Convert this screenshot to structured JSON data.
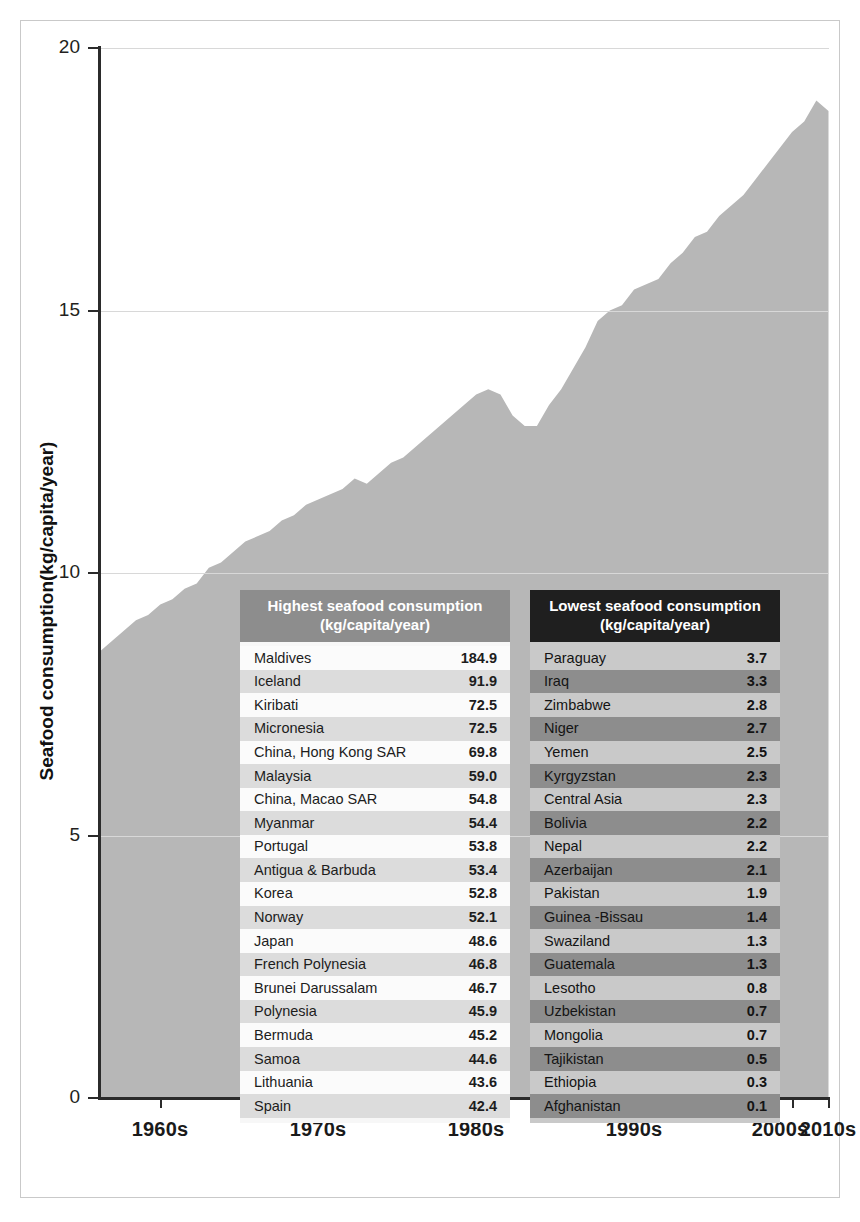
{
  "chart_data": {
    "type": "area",
    "title": "",
    "xlabel": "",
    "ylabel": "Seafood consumption(kg/capita/year)",
    "ylim": [
      0,
      20
    ],
    "y_ticks": [
      0,
      5,
      10,
      15,
      20
    ],
    "x_ticks": [
      "1960s",
      "1970s",
      "1980s",
      "1990s",
      "2000s",
      "2010s"
    ],
    "grid": "horizontal",
    "legend": "none",
    "series_name": "World seafood consumption",
    "series_color": "#b7b7b7",
    "x": [
      1955,
      1956,
      1957,
      1958,
      1959,
      1960,
      1961,
      1962,
      1963,
      1964,
      1965,
      1966,
      1967,
      1968,
      1969,
      1970,
      1971,
      1972,
      1973,
      1974,
      1975,
      1976,
      1977,
      1978,
      1979,
      1980,
      1981,
      1982,
      1983,
      1984,
      1985,
      1986,
      1987,
      1988,
      1989,
      1990,
      1991,
      1992,
      1993,
      1994,
      1995,
      1996,
      1997,
      1998,
      1999,
      2000,
      2001,
      2002,
      2003,
      2004,
      2005,
      2006,
      2007,
      2008,
      2009,
      2010,
      2011,
      2012,
      2013,
      2014,
      2015
    ],
    "values": [
      8.5,
      8.7,
      8.9,
      9.1,
      9.2,
      9.4,
      9.5,
      9.7,
      9.8,
      10.1,
      10.2,
      10.4,
      10.6,
      10.7,
      10.8,
      11.0,
      11.1,
      11.3,
      11.4,
      11.5,
      11.6,
      11.8,
      11.7,
      11.9,
      12.1,
      12.2,
      12.4,
      12.6,
      12.8,
      13.0,
      13.2,
      13.4,
      13.5,
      13.4,
      13.0,
      12.8,
      12.8,
      13.2,
      13.5,
      13.9,
      14.3,
      14.8,
      15.0,
      15.1,
      15.4,
      15.5,
      15.6,
      15.9,
      16.1,
      16.4,
      16.5,
      16.8,
      17.0,
      17.2,
      17.5,
      17.8,
      18.1,
      18.4,
      18.6,
      19.0,
      18.8
    ]
  },
  "axis": {
    "y_title": "Seafood consumption(kg/capita/year)",
    "y_ticks": [
      {
        "label": "20",
        "value": 20
      },
      {
        "label": "15",
        "value": 15
      },
      {
        "label": "10",
        "value": 10
      },
      {
        "label": "5",
        "value": 5
      },
      {
        "label": "0",
        "value": 0
      }
    ],
    "x_ticks": [
      {
        "label": "1960s"
      },
      {
        "label": "1970s"
      },
      {
        "label": "1980s"
      },
      {
        "label": "1990s"
      },
      {
        "label": "2000s"
      },
      {
        "label": "2010s"
      }
    ]
  },
  "tables": {
    "highest": {
      "header_line1": "Highest seafood consumption",
      "header_line2": "(kg/capita/year)",
      "rows": [
        {
          "country": "Maldives",
          "value": "184.9"
        },
        {
          "country": "Iceland",
          "value": "91.9"
        },
        {
          "country": "Kiribati",
          "value": "72.5"
        },
        {
          "country": "Micronesia",
          "value": "72.5"
        },
        {
          "country": "China, Hong Kong SAR",
          "value": "69.8"
        },
        {
          "country": "Malaysia",
          "value": "59.0"
        },
        {
          "country": "China, Macao SAR",
          "value": "54.8"
        },
        {
          "country": "Myanmar",
          "value": "54.4"
        },
        {
          "country": "Portugal",
          "value": "53.8"
        },
        {
          "country": "Antigua & Barbuda",
          "value": "53.4"
        },
        {
          "country": "Korea",
          "value": "52.8"
        },
        {
          "country": "Norway",
          "value": "52.1"
        },
        {
          "country": "Japan",
          "value": "48.6"
        },
        {
          "country": "French Polynesia",
          "value": "46.8"
        },
        {
          "country": "Brunei Darussalam",
          "value": "46.7"
        },
        {
          "country": "Polynesia",
          "value": "45.9"
        },
        {
          "country": "Bermuda",
          "value": "45.2"
        },
        {
          "country": "Samoa",
          "value": "44.6"
        },
        {
          "country": "Lithuania",
          "value": "43.6"
        },
        {
          "country": "Spain",
          "value": "42.4"
        }
      ]
    },
    "lowest": {
      "header_line1": "Lowest seafood consumption",
      "header_line2": "(kg/capita/year)",
      "rows": [
        {
          "country": "Paraguay",
          "value": "3.7"
        },
        {
          "country": "Iraq",
          "value": "3.3"
        },
        {
          "country": "Zimbabwe",
          "value": "2.8"
        },
        {
          "country": "Niger",
          "value": "2.7"
        },
        {
          "country": "Yemen",
          "value": "2.5"
        },
        {
          "country": "Kyrgyzstan",
          "value": "2.3"
        },
        {
          "country": "Central Asia",
          "value": "2.3"
        },
        {
          "country": "Bolivia",
          "value": "2.2"
        },
        {
          "country": "Nepal",
          "value": "2.2"
        },
        {
          "country": "Azerbaijan",
          "value": "2.1"
        },
        {
          "country": "Pakistan",
          "value": "1.9"
        },
        {
          "country": "Guinea -Bissau",
          "value": "1.4"
        },
        {
          "country": "Swaziland",
          "value": "1.3"
        },
        {
          "country": "Guatemala",
          "value": "1.3"
        },
        {
          "country": "Lesotho",
          "value": "0.8"
        },
        {
          "country": "Uzbekistan",
          "value": "0.7"
        },
        {
          "country": "Mongolia",
          "value": "0.7"
        },
        {
          "country": "Tajikistan",
          "value": "0.5"
        },
        {
          "country": "Ethiopia",
          "value": "0.3"
        },
        {
          "country": "Afghanistan",
          "value": "0.1"
        }
      ]
    }
  },
  "colors": {
    "area_fill": "#b7b7b7",
    "axis": "#2b2b2b",
    "grid": "#d8d8d8",
    "highest_header_bg": "#8d8d8d",
    "lowest_header_bg": "#1f1f1f",
    "frame_border": "#c9c9c9"
  }
}
